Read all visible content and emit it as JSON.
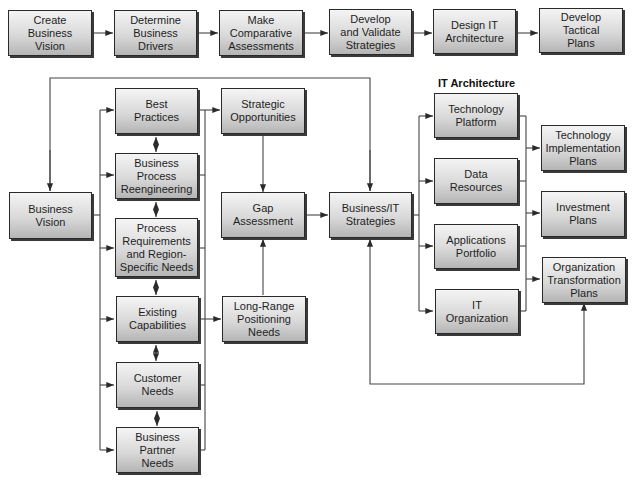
{
  "diagram": {
    "top_row": [
      {
        "id": "create-business-vision",
        "label": "Create\nBusiness\nVision"
      },
      {
        "id": "determine-business-drivers",
        "label": "Determine\nBusiness\nDrivers"
      },
      {
        "id": "make-comparative-assessments",
        "label": "Make\nComparative\nAssessments"
      },
      {
        "id": "develop-validate-strategies",
        "label": "Develop\nand Validate\nStrategies"
      },
      {
        "id": "design-it-architecture",
        "label": "Design IT\nArchitecture"
      },
      {
        "id": "develop-tactical-plans",
        "label": "Develop\nTactical\nPlans"
      }
    ],
    "business_vision": {
      "label": "Business\nVision"
    },
    "drivers": [
      {
        "id": "best-practices",
        "label": "Best\nPractices"
      },
      {
        "id": "business-process-reengineering",
        "label": "Business\nProcess\nReengineering"
      },
      {
        "id": "process-requirements",
        "label": "Process\nRequirements\nand Region-\nSpecific Needs"
      },
      {
        "id": "existing-capabilities",
        "label": "Existing\nCapabilities"
      },
      {
        "id": "customer-needs",
        "label": "Customer\nNeeds"
      },
      {
        "id": "business-partner-needs",
        "label": "Business\nPartner\nNeeds"
      }
    ],
    "assessment": {
      "strategic_opportunities": {
        "label": "Strategic\nOpportunities"
      },
      "gap_assessment": {
        "label": "Gap\nAssessment"
      },
      "long_range_positioning": {
        "label": "Long-Range\nPositioning\nNeeds"
      }
    },
    "business_it_strategies": {
      "label": "Business/IT\nStrategies"
    },
    "it_architecture": {
      "title": "IT Architecture",
      "components": [
        {
          "id": "technology-platform",
          "label": "Technology\nPlatform"
        },
        {
          "id": "data-resources",
          "label": "Data\nResources"
        },
        {
          "id": "applications-portfolio",
          "label": "Applications\nPortfolio"
        },
        {
          "id": "it-organization",
          "label": "IT\nOrganization"
        }
      ]
    },
    "plans": [
      {
        "id": "technology-implementation-plans",
        "label": "Technology\nImplementation\nPlans"
      },
      {
        "id": "investment-plans",
        "label": "Investment\nPlans"
      },
      {
        "id": "organization-transformation-plans",
        "label": "Organization\nTransformation\nPlans"
      }
    ],
    "colors": {
      "line": "#3a3a3a",
      "box_border": "#2a2a2a",
      "box_top": "#f4f4f4",
      "box_bottom": "#b5b5b5"
    }
  }
}
